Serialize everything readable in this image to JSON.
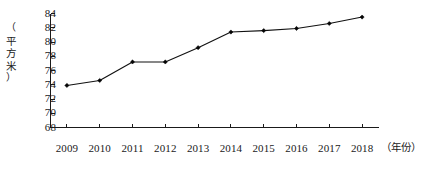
{
  "chart_data": {
    "type": "line",
    "title": "",
    "subtitle": "",
    "xlabel": "（年份）",
    "ylabel": "（平方米）",
    "categories": [
      "2009",
      "2010",
      "2011",
      "2012",
      "2013",
      "2014",
      "2015",
      "2016",
      "2017",
      "2018"
    ],
    "values": [
      73.9,
      74.6,
      77.2,
      77.2,
      79.2,
      81.4,
      81.6,
      81.9,
      82.6,
      83.5
    ],
    "series": [
      {
        "name": "人均住房建筑面积",
        "values": [
          73.9,
          74.6,
          77.2,
          77.2,
          79.2,
          81.4,
          81.6,
          81.9,
          82.6,
          83.5
        ]
      }
    ],
    "ylim": [
      68,
      84
    ],
    "yticks": [
      68,
      70,
      72,
      74,
      76,
      78,
      80,
      82,
      84
    ],
    "ytick_labels": [
      "68",
      "70",
      "72",
      "74",
      "76",
      "78",
      "80",
      "82",
      "84"
    ],
    "xtick_labels": [
      "2009",
      "2010",
      "2011",
      "2012",
      "2013",
      "2014",
      "2015",
      "2016",
      "2017",
      "2018"
    ],
    "grid": false,
    "legend": false,
    "legend_position": "none",
    "marker": "filled-diamond",
    "line_color": "#111111",
    "marker_color": "#050505",
    "axis_color": "#1a1a1a",
    "background_color": "#ffffff"
  },
  "axis": {
    "y_label_chars": [
      "（",
      "平",
      "方",
      "米",
      "）"
    ],
    "x_label_text": "（年份）"
  }
}
